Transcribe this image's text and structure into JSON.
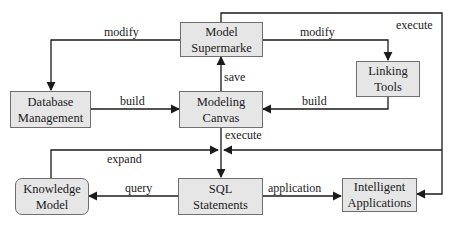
{
  "nodes": {
    "model_supermarket": {
      "line1": "Model",
      "line2": "Supermarke"
    },
    "database_management": {
      "line1": "Database",
      "line2": "Management"
    },
    "modeling_canvas": {
      "line1": "Modeling",
      "line2": "Canvas"
    },
    "linking_tools": {
      "line1": "Linking",
      "line2": "Tools"
    },
    "knowledge_model": {
      "line1": "Knowledge",
      "line2": "Model"
    },
    "sql_statements": {
      "line1": "SQL",
      "line2": "Statements"
    },
    "intelligent_applications": {
      "line1": "Intelligent",
      "line2": "Applications"
    }
  },
  "edges": {
    "supermarket_to_database": "modify",
    "supermarket_to_linking": "modify",
    "supermarket_execute": "execute",
    "database_to_canvas": "build",
    "linking_to_canvas": "build",
    "canvas_to_supermarket": "save",
    "canvas_to_sql": "execute",
    "knowledge_expand": "expand",
    "sql_to_knowledge": "query",
    "sql_to_applications": "application"
  },
  "colors": {
    "box_fill": "#e6e6e6",
    "box_border": "#6f6f6f",
    "line": "#1a1a1a"
  }
}
